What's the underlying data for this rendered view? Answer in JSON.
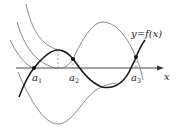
{
  "diagram": {
    "function_label": "y=f(x)",
    "axis_label": "x",
    "points": [
      {
        "name": "a",
        "sub": "1"
      },
      {
        "name": "a",
        "sub": "2"
      },
      {
        "name": "a",
        "sub": "3"
      }
    ],
    "colors": {
      "thick_curve": "#1a1a1a",
      "thin_curve": "#7a7a7a",
      "axis": "#333333",
      "dashed": "#888888"
    }
  }
}
